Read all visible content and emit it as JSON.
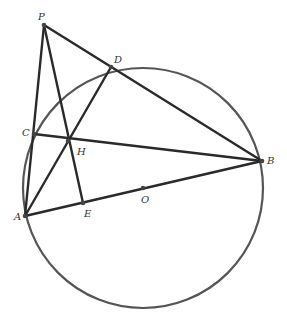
{
  "figure": {
    "type": "geometry",
    "circle": {
      "center": "O",
      "cx": 143,
      "cy": 188,
      "r": 120
    },
    "points": [
      {
        "id": "P",
        "label": "P",
        "x": 44,
        "y": 25,
        "lx": 38,
        "ly": 20
      },
      {
        "id": "D",
        "label": "D",
        "x": 111,
        "y": 67,
        "lx": 114,
        "ly": 63
      },
      {
        "id": "C",
        "label": "C",
        "x": 34,
        "y": 134,
        "lx": 22,
        "ly": 136
      },
      {
        "id": "H",
        "label": "H",
        "x": 68,
        "y": 141,
        "lx": 77,
        "ly": 155
      },
      {
        "id": "A",
        "label": "A",
        "x": 25,
        "y": 216,
        "lx": 14,
        "ly": 220
      },
      {
        "id": "E",
        "label": "E",
        "x": 83,
        "y": 203,
        "lx": 84,
        "ly": 217
      },
      {
        "id": "O",
        "label": "O",
        "x": 143,
        "y": 188,
        "lx": 141,
        "ly": 203
      },
      {
        "id": "B",
        "label": "B",
        "x": 262,
        "y": 161,
        "lx": 267,
        "ly": 164
      }
    ],
    "segments": [
      {
        "from": "P",
        "to": "A"
      },
      {
        "from": "P",
        "to": "B"
      },
      {
        "from": "P",
        "to": "E"
      },
      {
        "from": "A",
        "to": "B"
      },
      {
        "from": "A",
        "to": "D"
      },
      {
        "from": "C",
        "to": "B"
      }
    ],
    "colors": {
      "line": "#2a2a2a",
      "circle": "#555555",
      "label": "#333333",
      "background": "#ffffff"
    }
  }
}
